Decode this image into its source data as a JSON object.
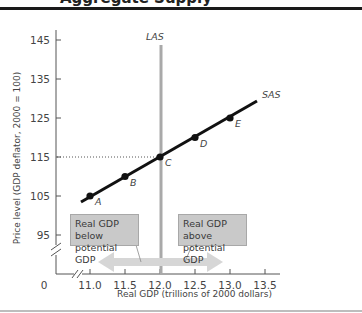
{
  "header": {
    "title": "Aggregate Supply"
  },
  "chart_data": {
    "type": "line",
    "title": "Aggregate Supply",
    "xlabel": "Real GDP (trillions of 2000 dollars)",
    "ylabel": "Price level (GDP deflator, 2000 = 100)",
    "xlim": [
      10.5,
      13.7
    ],
    "ylim": [
      85,
      148
    ],
    "x_ticks": [
      "11.0",
      "11.5",
      "12.0",
      "12.5",
      "13.0",
      "13.5"
    ],
    "y_ticks": [
      "95",
      "105",
      "115",
      "125",
      "135",
      "145"
    ],
    "origin_label": "0",
    "axis_breaks": true,
    "grid": false,
    "series": [
      {
        "name": "SAS",
        "label": "SAS",
        "points": [
          {
            "label": "A",
            "x": 11.0,
            "y": 105
          },
          {
            "label": "B",
            "x": 11.5,
            "y": 110
          },
          {
            "label": "C",
            "x": 12.0,
            "y": 115
          },
          {
            "label": "D",
            "x": 12.5,
            "y": 120
          },
          {
            "label": "E",
            "x": 13.0,
            "y": 125
          }
        ]
      },
      {
        "name": "LAS",
        "label": "LAS",
        "x": 12.0,
        "type": "vertical"
      }
    ],
    "reference_line": {
      "y": 115,
      "style": "dotted"
    },
    "annotations": [
      {
        "text_line1": "Real GDP below",
        "text_line2": "potential GDP",
        "direction": "left"
      },
      {
        "text_line1": "Real GDP above",
        "text_line2": "potential GDP",
        "direction": "right"
      }
    ]
  },
  "colors": {
    "sas": "#111111",
    "las": "#a9a9a9",
    "axis": "#555555",
    "arrow": "#d6d6d6",
    "box_fill": "#c9c9c9"
  }
}
